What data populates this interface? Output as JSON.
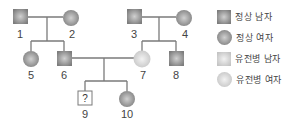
{
  "pedigree": {
    "individuals": [
      {
        "id": "1",
        "label": "1",
        "sex": "male",
        "status": "normal"
      },
      {
        "id": "2",
        "label": "2",
        "sex": "female",
        "status": "normal"
      },
      {
        "id": "3",
        "label": "3",
        "sex": "male",
        "status": "normal"
      },
      {
        "id": "4",
        "label": "4",
        "sex": "female",
        "status": "normal"
      },
      {
        "id": "5",
        "label": "5",
        "sex": "female",
        "status": "normal"
      },
      {
        "id": "6",
        "label": "6",
        "sex": "male",
        "status": "normal"
      },
      {
        "id": "7",
        "label": "7",
        "sex": "female",
        "status": "affected"
      },
      {
        "id": "8",
        "label": "8",
        "sex": "male",
        "status": "normal"
      },
      {
        "id": "9",
        "label": "9",
        "sex": "male",
        "status": "unknown",
        "mark": "?"
      },
      {
        "id": "10",
        "label": "10",
        "sex": "female",
        "status": "normal"
      }
    ],
    "unknown_mark": "?"
  },
  "legend": {
    "items": [
      {
        "label": "정상 남자",
        "symbol": "square",
        "fill": "#8c8c8c"
      },
      {
        "label": "정상 여자",
        "symbol": "circle",
        "fill": "#8c8c8c"
      },
      {
        "label": "유전병 남자",
        "symbol": "square",
        "fill": "#d4d4d4"
      },
      {
        "label": "유전병 여자",
        "symbol": "circle",
        "fill": "#d4d4d4"
      }
    ]
  },
  "colors": {
    "normal": "#8c8c8c",
    "affected": "#d4d4d4",
    "line": "#7a7a7a"
  }
}
